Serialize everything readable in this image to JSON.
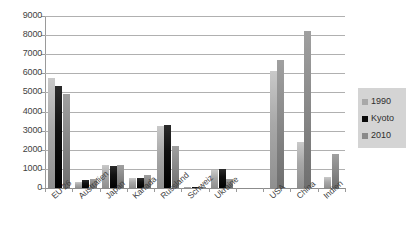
{
  "chart_data": {
    "type": "bar",
    "title": "",
    "subtitle": "",
    "xlabel": "",
    "ylabel": "",
    "ylim": [
      0,
      9000
    ],
    "ytick_step": 1000,
    "yticks": [
      "0",
      "1000",
      "2000",
      "3000",
      "4000",
      "5000",
      "6000",
      "7000",
      "8000",
      "9000"
    ],
    "grid": true,
    "legend_position": "right",
    "categories": [
      "EU 26",
      "Australien",
      "Japan",
      "Kanada",
      "Russland",
      "Schweiz",
      "Ukraine",
      "",
      "USA",
      "China",
      "Indien"
    ],
    "series": [
      {
        "name": "1990",
        "color": "#a8a8a8",
        "values": [
          5750,
          300,
          1180,
          500,
          3250,
          50,
          950,
          null,
          6100,
          2400,
          600
        ]
      },
      {
        "name": "Kyoto",
        "color": "#0a0a0a",
        "values": [
          5350,
          400,
          1130,
          520,
          3300,
          55,
          1000,
          null,
          null,
          null,
          null
        ]
      },
      {
        "name": "2010",
        "color": "#8a8a8a",
        "values": [
          4900,
          490,
          1210,
          670,
          2180,
          60,
          450,
          null,
          6700,
          8200,
          1800
        ]
      }
    ]
  },
  "legend": {
    "items": [
      {
        "label": "1990",
        "swatch": "series-1990-swatch"
      },
      {
        "label": "Kyoto",
        "swatch": "series-kyoto-swatch"
      },
      {
        "label": "2010",
        "swatch": "series-2010-swatch"
      }
    ]
  }
}
